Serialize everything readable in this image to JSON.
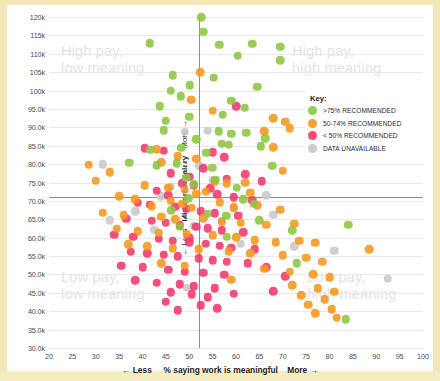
{
  "axes": {
    "y_prefix_less": "← Less",
    "y_title": "Mid-career salary",
    "y_suffix_more": "More →",
    "x_prefix_less": "←  Less",
    "x_title": "% saying work is meaningful",
    "x_suffix_more": "More  →",
    "y_ticks": [
      "120k",
      "115k",
      "110k",
      "105k",
      "100k",
      "95.0k",
      "90.0k",
      "85.0k",
      "80.0k",
      "75.0k",
      "70.0k",
      "65.0k",
      "60.0k",
      "55.0k",
      "50.0k",
      "45.0k",
      "40.0k",
      "35.0k",
      "30.0k"
    ],
    "x_ticks": [
      "20",
      "25",
      "30",
      "35",
      "40",
      "45",
      "50",
      "55",
      "60",
      "65",
      "70",
      "75",
      "80",
      "85",
      "90",
      "95",
      "100"
    ]
  },
  "quadrants": {
    "top_left": "High pay,\nlow meaning",
    "top_right": "High pay,\nhigh meaning",
    "bottom_left": "Low pay,\nlow meaning",
    "bottom_right": "Low pay,\nhigh meaning"
  },
  "legend": {
    "title": "Key:",
    "items": [
      {
        "label": ">75% RECOMMENDED",
        "color": "#8cc641"
      },
      {
        "label": "50-74% RECOMMENDED",
        "color": "#f5971d"
      },
      {
        "label": "< 50% RECOMMENDED",
        "color": "#f4386b"
      },
      {
        "label": "DATA UNAVAILABLE",
        "color": "#c8c8c8"
      }
    ]
  },
  "chart_data": {
    "type": "scatter",
    "title": "",
    "xlabel": "% saying work is meaningful",
    "ylabel": "Mid-career salary",
    "xlim": [
      20,
      100
    ],
    "ylim": [
      30000,
      120000
    ],
    "grid": true,
    "legend_position": "right",
    "crosshair": {
      "x": 52,
      "y": 71000
    },
    "colors": {
      "green": "#8cc641",
      "orange": "#f5971d",
      "pink": "#f4386b",
      "gray": "#c8c8c8"
    },
    "series": [
      {
        "name": ">75% RECOMMENDED",
        "color": "#8cc641",
        "points": [
          [
            52.6,
            120000
          ],
          [
            56.4,
            112500
          ],
          [
            63.5,
            112700
          ],
          [
            69.5,
            111900
          ],
          [
            60.4,
            109500
          ],
          [
            69.5,
            108200
          ],
          [
            46.5,
            104200
          ],
          [
            55.2,
            103500
          ],
          [
            50.1,
            101400
          ],
          [
            64.5,
            101000
          ],
          [
            46.0,
            100000
          ],
          [
            48.2,
            98500
          ],
          [
            59.0,
            97200
          ],
          [
            43.7,
            95700
          ],
          [
            61.9,
            95300
          ],
          [
            57.2,
            93400
          ],
          [
            50.0,
            92900
          ],
          [
            45.0,
            91800
          ],
          [
            44.5,
            89200
          ],
          [
            56.3,
            89000
          ],
          [
            59.0,
            88300
          ],
          [
            62.2,
            88500
          ],
          [
            66.3,
            87000
          ],
          [
            51.5,
            86700
          ],
          [
            57.0,
            85600
          ],
          [
            58.5,
            85200
          ],
          [
            48.3,
            84400
          ],
          [
            41.7,
            83900
          ],
          [
            37.2,
            80400
          ],
          [
            47.3,
            80200
          ],
          [
            43.0,
            79700
          ],
          [
            53.6,
            83100
          ],
          [
            54.9,
            79000
          ],
          [
            65.3,
            84800
          ],
          [
            67.7,
            79600
          ],
          [
            49.4,
            76300
          ],
          [
            51.0,
            74500
          ],
          [
            55.6,
            75700
          ],
          [
            60.2,
            73600
          ],
          [
            49.8,
            70700
          ],
          [
            61.5,
            70400
          ],
          [
            63.8,
            69200
          ],
          [
            46.1,
            67400
          ],
          [
            54.0,
            66500
          ],
          [
            57.9,
            65900
          ],
          [
            65.0,
            64800
          ],
          [
            48.0,
            63000
          ],
          [
            72.0,
            62000
          ],
          [
            58.0,
            60200
          ],
          [
            84.0,
            63500
          ],
          [
            73.0,
            53000
          ],
          [
            83.5,
            37800
          ],
          [
            41.5,
            112900
          ],
          [
            53.0,
            116000
          ]
        ]
      },
      {
        "name": "50-74% RECOMMENDED",
        "color": "#f5971d",
        "points": [
          [
            52.3,
            105000
          ],
          [
            50.4,
            97500
          ],
          [
            55.0,
            94500
          ],
          [
            68.0,
            92500
          ],
          [
            70.5,
            91500
          ],
          [
            71.5,
            89700
          ],
          [
            66.0,
            88900
          ],
          [
            68.0,
            84600
          ],
          [
            43.0,
            84000
          ],
          [
            47.5,
            82100
          ],
          [
            51.5,
            81400
          ],
          [
            44.0,
            80500
          ],
          [
            28.5,
            79800
          ],
          [
            33.0,
            77800
          ],
          [
            70.0,
            78200
          ],
          [
            55.5,
            75300
          ],
          [
            58.0,
            74800
          ],
          [
            62.0,
            75000
          ],
          [
            40.5,
            74300
          ],
          [
            45.5,
            73600
          ],
          [
            49.0,
            73000
          ],
          [
            51.5,
            72000
          ],
          [
            53.5,
            72500
          ],
          [
            35.0,
            71200
          ],
          [
            38.5,
            70500
          ],
          [
            46.0,
            70000
          ],
          [
            48.5,
            69200
          ],
          [
            42.0,
            68600
          ],
          [
            50.5,
            68200
          ],
          [
            56.5,
            69600
          ],
          [
            59.5,
            68300
          ],
          [
            64.5,
            68800
          ],
          [
            69.5,
            67600
          ],
          [
            31.5,
            66800
          ],
          [
            36.0,
            66100
          ],
          [
            44.0,
            65700
          ],
          [
            47.0,
            65000
          ],
          [
            53.0,
            65300
          ],
          [
            57.0,
            64300
          ],
          [
            61.0,
            64000
          ],
          [
            66.5,
            63500
          ],
          [
            72.5,
            63800
          ],
          [
            34.5,
            62400
          ],
          [
            39.0,
            61800
          ],
          [
            43.5,
            61400
          ],
          [
            49.5,
            61000
          ],
          [
            55.0,
            60600
          ],
          [
            60.0,
            60100
          ],
          [
            64.0,
            59300
          ],
          [
            68.5,
            58800
          ],
          [
            73.5,
            59100
          ],
          [
            77.0,
            58600
          ],
          [
            37.0,
            58200
          ],
          [
            41.0,
            57600
          ],
          [
            46.5,
            57100
          ],
          [
            52.0,
            56800
          ],
          [
            58.5,
            56300
          ],
          [
            63.0,
            55800
          ],
          [
            70.0,
            55200
          ],
          [
            75.0,
            54600
          ],
          [
            78.5,
            53400
          ],
          [
            44.0,
            53000
          ],
          [
            49.0,
            52400
          ],
          [
            66.0,
            51500
          ],
          [
            71.5,
            50800
          ],
          [
            76.5,
            50100
          ],
          [
            80.0,
            49200
          ],
          [
            59.0,
            48600
          ],
          [
            72.0,
            47000
          ],
          [
            77.5,
            46200
          ],
          [
            81.0,
            45300
          ],
          [
            74.0,
            44300
          ],
          [
            79.0,
            43200
          ],
          [
            75.5,
            41800
          ],
          [
            80.5,
            40600
          ],
          [
            77.0,
            39400
          ],
          [
            81.5,
            38200
          ],
          [
            63.0,
            72200
          ],
          [
            88.5,
            56800
          ],
          [
            30.0,
            75500
          ]
        ]
      },
      {
        "name": "< 50% RECOMMENDED",
        "color": "#f4386b",
        "points": [
          [
            60.0,
            95800
          ],
          [
            40.5,
            84300
          ],
          [
            44.5,
            83600
          ],
          [
            55.0,
            83200
          ],
          [
            57.5,
            81900
          ],
          [
            53.0,
            78900
          ],
          [
            46.0,
            77500
          ],
          [
            50.0,
            76500
          ],
          [
            58.0,
            76000
          ],
          [
            62.0,
            77200
          ],
          [
            65.5,
            75400
          ],
          [
            48.5,
            74800
          ],
          [
            51.0,
            74200
          ],
          [
            54.5,
            73400
          ],
          [
            43.0,
            72800
          ],
          [
            45.5,
            71500
          ],
          [
            56.0,
            71800
          ],
          [
            59.5,
            71000
          ],
          [
            63.5,
            70200
          ],
          [
            39.0,
            69500
          ],
          [
            41.5,
            68900
          ],
          [
            47.0,
            68400
          ],
          [
            49.5,
            67800
          ],
          [
            52.5,
            67200
          ],
          [
            55.5,
            66600
          ],
          [
            60.5,
            66000
          ],
          [
            36.5,
            65200
          ],
          [
            42.0,
            64600
          ],
          [
            45.0,
            64000
          ],
          [
            48.0,
            63400
          ],
          [
            51.5,
            63000
          ],
          [
            54.0,
            62500
          ],
          [
            57.0,
            62000
          ],
          [
            61.5,
            61500
          ],
          [
            34.0,
            60800
          ],
          [
            38.0,
            60200
          ],
          [
            43.5,
            59700
          ],
          [
            46.5,
            59200
          ],
          [
            50.0,
            58700
          ],
          [
            53.5,
            58300
          ],
          [
            56.5,
            57800
          ],
          [
            59.0,
            57300
          ],
          [
            64.0,
            56900
          ],
          [
            37.5,
            56200
          ],
          [
            41.0,
            55700
          ],
          [
            44.5,
            55300
          ],
          [
            47.5,
            54900
          ],
          [
            52.0,
            54400
          ],
          [
            55.0,
            53900
          ],
          [
            58.0,
            53500
          ],
          [
            62.5,
            53000
          ],
          [
            35.5,
            52400
          ],
          [
            40.0,
            51900
          ],
          [
            45.5,
            51300
          ],
          [
            49.0,
            50800
          ],
          [
            53.0,
            50400
          ],
          [
            57.5,
            49900
          ],
          [
            66.5,
            52000
          ],
          [
            70.5,
            49500
          ],
          [
            38.5,
            48400
          ],
          [
            43.0,
            47800
          ],
          [
            48.0,
            47300
          ],
          [
            51.0,
            46800
          ],
          [
            55.5,
            46200
          ],
          [
            46.0,
            45200
          ],
          [
            50.5,
            44600
          ],
          [
            54.0,
            43800
          ],
          [
            59.5,
            44800
          ],
          [
            68.0,
            45400
          ],
          [
            45.0,
            42600
          ],
          [
            52.5,
            41600
          ],
          [
            47.5,
            40200
          ],
          [
            50.0,
            60000
          ],
          [
            56.0,
            40800
          ]
        ]
      },
      {
        "name": "DATA UNAVAILABLE",
        "color": "#c8c8c8",
        "points": [
          [
            54.0,
            89100
          ],
          [
            49.0,
            88800
          ],
          [
            52.0,
            79700
          ],
          [
            31.5,
            79900
          ],
          [
            55.0,
            75600
          ],
          [
            46.0,
            73800
          ],
          [
            44.0,
            71300
          ],
          [
            38.5,
            67200
          ],
          [
            33.0,
            64800
          ],
          [
            51.0,
            63200
          ],
          [
            57.0,
            64500
          ],
          [
            66.5,
            71500
          ],
          [
            68.0,
            66200
          ],
          [
            61.0,
            58400
          ],
          [
            72.5,
            57600
          ],
          [
            81.0,
            56400
          ],
          [
            92.5,
            48800
          ],
          [
            49.5,
            46400
          ],
          [
            42.5,
            62200
          ],
          [
            59.5,
            67900
          ]
        ]
      }
    ]
  }
}
